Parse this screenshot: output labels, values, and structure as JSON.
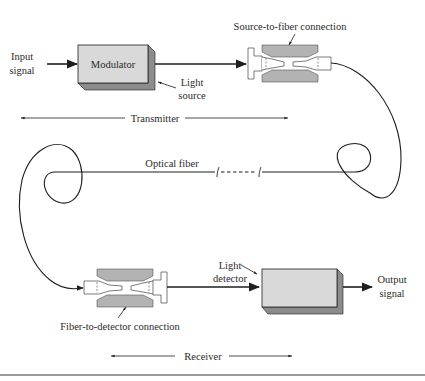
{
  "diagram": {
    "type": "fiber-optic communication system block diagram",
    "colors": {
      "line": "#1e1e1e",
      "box_face": "#d9d9d9",
      "box_shadow": "#8c8c8c",
      "connector_fill": "#b3b3b3",
      "rule": "#7a7a7a",
      "background": "#ffffff"
    },
    "transmitter": {
      "input_label_line1": "Input",
      "input_label_line2": "signal",
      "modulator_label": "Modulator",
      "light_source_line1": "Light",
      "light_source_line2": "source",
      "connection_label": "Source-to-fiber connection",
      "section_label": "Transmitter"
    },
    "fiber": {
      "label": "Optical fiber"
    },
    "receiver": {
      "connection_label": "Fiber-to-detector connection",
      "detector_line1": "Light",
      "detector_line2": "detector",
      "detector_box_label": "",
      "output_label_line1": "Output",
      "output_label_line2": "signal",
      "section_label": "Receiver"
    }
  }
}
